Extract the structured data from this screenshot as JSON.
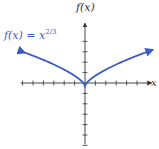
{
  "chart_data": {
    "type": "line",
    "title": "",
    "function": "f(x) = x^(2/3)",
    "xlabel": "x",
    "ylabel": "f(x)",
    "xlim": [
      -6,
      6
    ],
    "ylim": [
      -6,
      4
    ],
    "x_ticks": [
      -6,
      -5,
      -4,
      -3,
      -2,
      -1,
      1,
      2,
      3,
      4,
      5,
      6
    ],
    "y_ticks": [
      -6,
      -5,
      -4,
      -3,
      -2,
      -1,
      1,
      2,
      3,
      4
    ],
    "tick_labels_shown": false,
    "grid": false,
    "series": [
      {
        "name": "f(x) = x^(2/3)",
        "color": "#3a5cc4",
        "x": [
          -6,
          -5,
          -4,
          -3,
          -2,
          -1,
          0,
          1,
          2,
          3,
          4,
          5,
          6
        ],
        "values": [
          3.3,
          2.92,
          2.52,
          2.08,
          1.59,
          1.0,
          0,
          1.0,
          1.59,
          2.08,
          2.52,
          2.92,
          3.3
        ]
      }
    ],
    "annotations": [
      {
        "text": "f(x) = x",
        "superscript": "2/3",
        "position": "upper-left",
        "color": "#3a5cc4"
      }
    ]
  },
  "labels": {
    "y_axis": "f(x)",
    "x_axis": "x",
    "function_base": "f(x) = x",
    "function_exp": "2/3"
  },
  "colors": {
    "curve": "#3a5cc4",
    "axis": "#333333"
  }
}
